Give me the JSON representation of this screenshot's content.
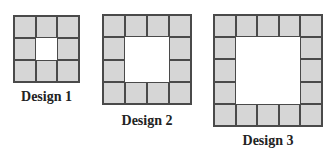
{
  "colors": {
    "tile_fill": "#d6d6d6",
    "grid_line": "#4a4a4a",
    "background": "#ffffff"
  },
  "designs": [
    {
      "label": "Design 1",
      "size": 3,
      "border_tiles": 8,
      "hole": 1
    },
    {
      "label": "Design 2",
      "size": 4,
      "border_tiles": 12,
      "hole": 2
    },
    {
      "label": "Design 3",
      "size": 5,
      "border_tiles": 16,
      "hole": 3
    }
  ]
}
